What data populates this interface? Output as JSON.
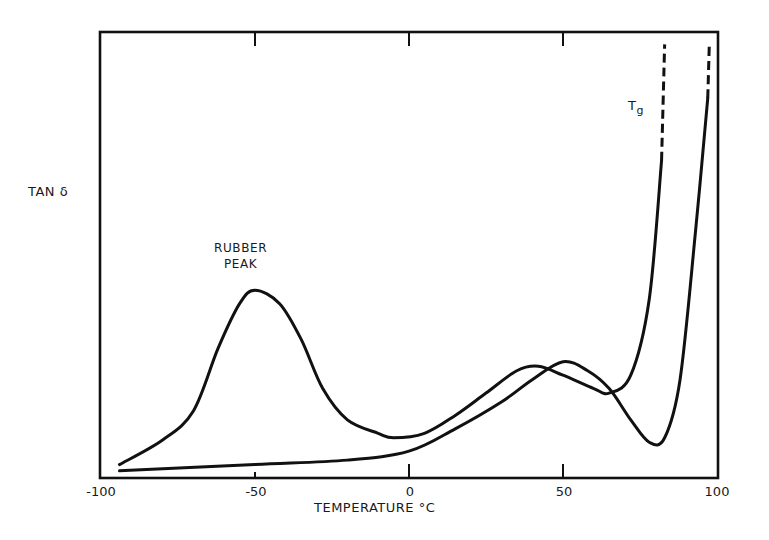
{
  "chart_data": {
    "type": "line",
    "title": "",
    "xlabel": "TEMPERATURE °C",
    "ylabel": "TAN δ",
    "xlim": [
      -100,
      100
    ],
    "ylim": [
      0,
      1.0
    ],
    "y_units": "relative (no numeric ticks shown)",
    "x_ticks": [
      -100,
      -50,
      0,
      50,
      100
    ],
    "x_tick_labels": [
      "-100",
      "-50",
      "0",
      "50",
      "100"
    ],
    "grid": false,
    "legend": null,
    "annotations": [
      {
        "text": "RUBBER PEAK",
        "x": -50,
        "y": 0.5
      },
      {
        "text": "Tg",
        "x": 75,
        "y": 0.9
      }
    ],
    "series": [
      {
        "name": "rubber-modified (with rubber peak)",
        "x": [
          -94,
          -80,
          -70,
          -62,
          -55,
          -50,
          -42,
          -35,
          -28,
          -20,
          -10,
          -5,
          5,
          15,
          25,
          35,
          42,
          50,
          60,
          65,
          72,
          78,
          82,
          83
        ],
        "values": [
          0.03,
          0.085,
          0.15,
          0.29,
          0.39,
          0.42,
          0.39,
          0.31,
          0.2,
          0.13,
          0.1,
          0.09,
          0.1,
          0.14,
          0.19,
          0.24,
          0.25,
          0.23,
          0.2,
          0.19,
          0.23,
          0.4,
          0.71,
          0.97
        ],
        "dashed_from_x": 83,
        "dashed_from_y": 0.85
      },
      {
        "name": "unmodified",
        "x": [
          -94,
          -50,
          -20,
          0,
          15,
          30,
          40,
          50,
          58,
          65,
          72,
          78,
          83,
          88,
          93,
          97,
          97.5
        ],
        "values": [
          0.016,
          0.03,
          0.04,
          0.06,
          0.11,
          0.17,
          0.22,
          0.26,
          0.24,
          0.2,
          0.13,
          0.08,
          0.09,
          0.22,
          0.55,
          0.85,
          0.97
        ],
        "dashed_from_x": 97,
        "dashed_from_y": 0.85
      }
    ]
  },
  "labels": {
    "ylabel": "TAN δ",
    "xlabel": "TEMPERATURE °C",
    "rubber_peak_line1": "RUBBER",
    "rubber_peak_line2": "PEAK",
    "tg": "T",
    "tg_sub": "g",
    "ticks": [
      "-100",
      "-50",
      "0",
      "50",
      "100"
    ]
  },
  "colors": {
    "line": "#111111",
    "background": "#ffffff"
  }
}
